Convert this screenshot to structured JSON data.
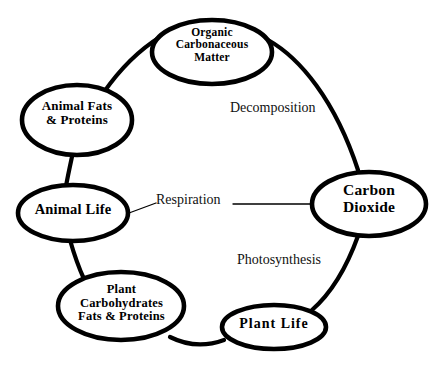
{
  "diagram": {
    "type": "cycle-diagram",
    "background_color": "#ffffff",
    "stroke_color": "#000000",
    "nodes": [
      {
        "id": "organic-matter",
        "label": "Organic\nCarbonaceous\nMatter",
        "shape": "ellipse"
      },
      {
        "id": "animal-fats",
        "label": "Animal Fats\n& Proteins",
        "shape": "ellipse"
      },
      {
        "id": "animal-life",
        "label": "Animal Life",
        "shape": "ellipse"
      },
      {
        "id": "carbon-dioxide",
        "label": "Carbon\nDioxide",
        "shape": "ellipse"
      },
      {
        "id": "plant-carbohydrates",
        "label": "Plant\nCarbohydrates\nFats & Proteins",
        "shape": "ellipse"
      },
      {
        "id": "plant-life",
        "label": "Plant Life",
        "shape": "ellipse"
      }
    ],
    "edges": [
      {
        "id": "decomposition",
        "label": "Decomposition",
        "from": "organic-matter",
        "to": "carbon-dioxide"
      },
      {
        "id": "respiration",
        "label": "Respiration",
        "from": "animal-life",
        "to": "carbon-dioxide"
      },
      {
        "id": "photosynthesis",
        "label": "Photosynthesis",
        "from": "carbon-dioxide",
        "to": "plant-life"
      },
      {
        "id": "plant-life-to-plant-carbs",
        "label": "",
        "from": "plant-life",
        "to": "plant-carbohydrates"
      },
      {
        "id": "plant-carbs-to-animal-life",
        "label": "",
        "from": "plant-carbohydrates",
        "to": "animal-life"
      },
      {
        "id": "animal-life-to-animal-fats",
        "label": "",
        "from": "animal-life",
        "to": "animal-fats"
      },
      {
        "id": "animal-fats-to-organic-matter",
        "label": "",
        "from": "animal-fats",
        "to": "organic-matter"
      }
    ]
  }
}
